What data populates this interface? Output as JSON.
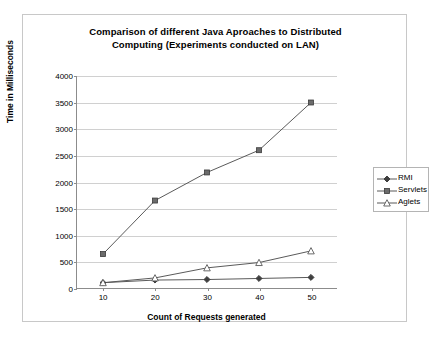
{
  "chart_data": {
    "type": "line",
    "title": "Comparison of different Java Aproaches to Distributed Computing (Experiments conducted on LAN)",
    "title_line1": "Comparison of different Java Aproaches to Distributed",
    "title_line2": "Computing (Experiments conducted on LAN)",
    "xlabel": "Count of Requests generated",
    "ylabel": "Time in Milliseconds",
    "x": [
      10,
      20,
      30,
      40,
      50
    ],
    "xtick_labels": [
      "10",
      "20",
      "30",
      "40",
      "50"
    ],
    "ytick_labels": [
      "0",
      "500",
      "1000",
      "1500",
      "2000",
      "2500",
      "3000",
      "3500",
      "4000"
    ],
    "yticks": [
      0,
      500,
      1000,
      1500,
      2000,
      2500,
      3000,
      3500,
      4000
    ],
    "ylim": [
      0,
      4000
    ],
    "xlim": [
      5,
      55
    ],
    "grid": true,
    "legend_position": "right",
    "series": [
      {
        "name": "RMI",
        "marker": "filled-diamond",
        "color": "#3f3f3f",
        "values": [
          100,
          150,
          160,
          180,
          200
        ]
      },
      {
        "name": "Servlets",
        "marker": "filled-square",
        "color": "#6b6b6b",
        "values": [
          640,
          1650,
          2180,
          2600,
          3500
        ]
      },
      {
        "name": "Aglets",
        "marker": "open-triangle",
        "color": "#5a5a5a",
        "values": [
          100,
          190,
          380,
          480,
          700
        ]
      }
    ]
  },
  "legend": {
    "items": [
      {
        "label": "RMI"
      },
      {
        "label": "Servlets"
      },
      {
        "label": "Aglets"
      }
    ]
  }
}
